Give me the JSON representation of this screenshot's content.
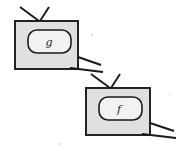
{
  "figure": {
    "background_color": "#ffffff",
    "width": 181,
    "height": 151,
    "ink_color": "#1a1a1a",
    "node_fill_color": "#e0e0e0",
    "inner_fill_color": "#f2f2f2"
  },
  "nodes": [
    {
      "id": "g",
      "label": "g",
      "label_x": 49,
      "label_y": 46,
      "label_size": 11,
      "body": {
        "x": 15,
        "y": 21,
        "width": 63,
        "height": 48
      },
      "inner": {
        "x": 28,
        "y": 30,
        "width": 43,
        "height": 23,
        "rx": 9
      },
      "input_wires": [
        {
          "name": "g-input-left",
          "x1": 20,
          "y1": 7,
          "x2": 39,
          "y2": 21
        },
        {
          "name": "g-input-right",
          "x1": 49,
          "y1": 7,
          "x2": 40,
          "y2": 21
        }
      ],
      "output_wires": [
        {
          "name": "g-output-upper",
          "x1": 78,
          "y1": 57,
          "x2": 101,
          "y2": 65
        },
        {
          "name": "g-output-lower",
          "x1": 70,
          "y1": 68,
          "x2": 103,
          "y2": 72
        }
      ]
    },
    {
      "id": "f",
      "label": "f",
      "label_x": 119,
      "label_y": 113,
      "label_size": 11,
      "body": {
        "x": 86,
        "y": 88,
        "width": 64,
        "height": 47
      },
      "inner": {
        "x": 99,
        "y": 97,
        "width": 43,
        "height": 23,
        "rx": 9
      },
      "input_wires": [
        {
          "name": "f-input-left",
          "x1": 91,
          "y1": 74,
          "x2": 110,
          "y2": 88
        },
        {
          "name": "f-input-right",
          "x1": 120,
          "y1": 74,
          "x2": 111,
          "y2": 88
        }
      ],
      "output_wires": [
        {
          "name": "f-output-upper",
          "x1": 150,
          "y1": 123,
          "x2": 174,
          "y2": 131
        },
        {
          "name": "f-output-lower",
          "x1": 142,
          "y1": 134,
          "x2": 176,
          "y2": 138
        }
      ]
    }
  ],
  "specks": [
    {
      "name": "paper-speck-1",
      "cx": 92,
      "cy": 35,
      "r": 1.0
    },
    {
      "name": "paper-speck-2",
      "cx": 59,
      "cy": 144,
      "r": 0.9
    },
    {
      "name": "paper-speck-3",
      "cx": 170,
      "cy": 94,
      "r": 0.8
    }
  ]
}
